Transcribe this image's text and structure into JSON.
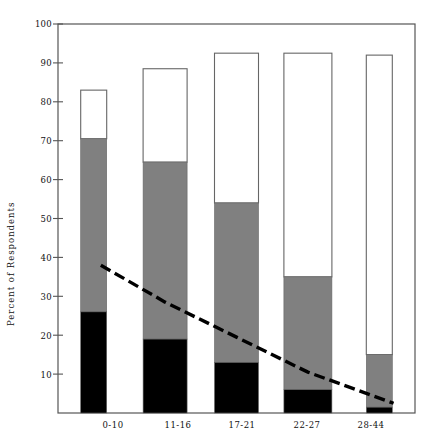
{
  "chart_data": {
    "type": "bar",
    "subtype": "stacked-bar-with-trendline",
    "title": "",
    "xlabel": "",
    "ylabel": "Percent of Respondents",
    "categories": [
      "0-10",
      "11-16",
      "17-21",
      "22-27",
      "28-44"
    ],
    "ylim": [
      0,
      100
    ],
    "xlim_note": "categorical",
    "grid": false,
    "legend": "none",
    "ytick_labels": [
      "10",
      "20",
      "30",
      "40",
      "50",
      "60",
      "70",
      "80",
      "90",
      "100"
    ],
    "ytick_values": [
      10,
      20,
      30,
      40,
      50,
      60,
      70,
      80,
      90,
      100
    ],
    "series": [
      {
        "name": "black-segment",
        "color": "#000000",
        "stack_order": 1,
        "values": [
          26,
          19,
          13,
          6,
          1.5
        ]
      },
      {
        "name": "gray-segment",
        "color": "#808080",
        "stack_order": 2,
        "values": [
          44.5,
          45.5,
          41,
          29,
          13.5
        ]
      },
      {
        "name": "white-segment",
        "color": "#ffffff",
        "stack_order": 3,
        "values": [
          12.5,
          24,
          38.5,
          57.5,
          77
        ]
      }
    ],
    "stack_totals": [
      83,
      88.5,
      92.5,
      92.5,
      92
    ],
    "stack_boundaries": {
      "black_top": [
        26,
        19,
        13,
        6,
        1.5
      ],
      "gray_top": [
        70.5,
        64.5,
        54,
        35,
        15
      ],
      "bar_top": [
        83,
        88.5,
        92.5,
        92.5,
        92
      ]
    },
    "trendline": {
      "name": "dashed-trend",
      "style": "dashed",
      "color": "#000000",
      "x_categories": [
        "0-10",
        "11-16",
        "17-21",
        "22-27",
        "28-44"
      ],
      "points": [
        {
          "x": 0.1,
          "y": 38.0
        },
        {
          "x": 1.0,
          "y": 28.5
        },
        {
          "x": 2.0,
          "y": 19.5
        },
        {
          "x": 3.0,
          "y": 10.5
        },
        {
          "x": 4.2,
          "y": 2.5
        }
      ]
    }
  },
  "axes": {
    "y_axis_label": "Percent of Respondents",
    "y_ticks": [
      "100",
      "90",
      "80",
      "70",
      "60",
      "50",
      "40",
      "30",
      "20",
      "10"
    ],
    "x_ticks": [
      "0-10",
      "11-16",
      "17-21",
      "22-27",
      "28-44"
    ]
  },
  "colors": {
    "black": "#000000",
    "gray": "#808080",
    "white": "#ffffff",
    "axis": "#555555",
    "text": "#111111"
  }
}
